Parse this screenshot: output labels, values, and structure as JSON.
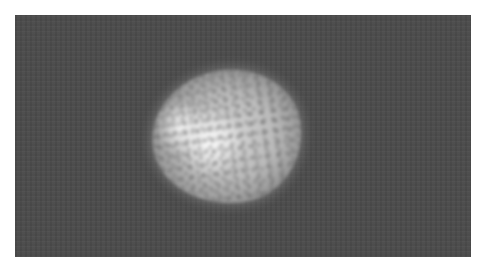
{
  "image": {
    "description": "Grayscale micrograph of a bright, roughly round speckled particle on a dark gray background",
    "colors": {
      "border": "#ffffff",
      "background": "#4b4b4b",
      "particle_highlight": "#f2f2f2",
      "particle_mid": "#b9b9b9"
    }
  }
}
